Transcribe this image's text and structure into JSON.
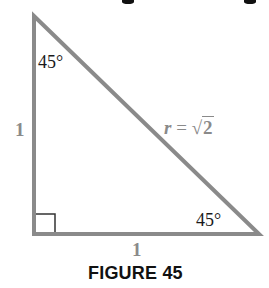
{
  "figure": {
    "caption": "FIGURE 45",
    "top_angle_label": "45°",
    "bottom_right_angle_label": "45°",
    "left_side_label": "1",
    "bottom_side_label": "1",
    "hypotenuse": {
      "variable": "r",
      "equals": " = ",
      "radical": "√",
      "radicand": "2"
    },
    "right_angle_marker": true,
    "colors": {
      "stroke": "#8a8a8a",
      "marker": "#333333",
      "angle_text": "#1a1a1a",
      "side_text": "#8a8a8a",
      "caption_text": "#111111"
    },
    "vertices": {
      "top": [
        34,
        16
      ],
      "bottom_left": [
        34,
        234
      ],
      "bottom_right": [
        259,
        234
      ]
    }
  }
}
